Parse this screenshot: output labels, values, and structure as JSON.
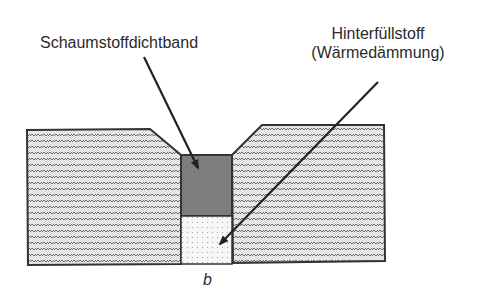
{
  "diagram": {
    "labels": {
      "seal_tape": "Schaumstoffdichtband",
      "backfill_line1": "Hinterfüllstoff",
      "backfill_line2": "(Wärmedämmung)",
      "joint_width": "b"
    },
    "colors": {
      "outline": "#333333",
      "block_fill": "#d9d9d9",
      "block_hatch": "#555555",
      "seal_fill": "#7a7a7a",
      "backfill_fill": "#f4f4f4",
      "backfill_dots": "#9a9a9a",
      "arrow": "#222222"
    }
  }
}
